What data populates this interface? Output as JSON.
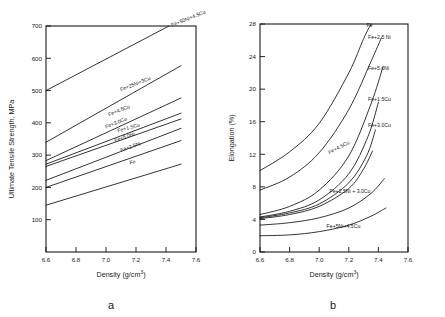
{
  "figure": {
    "panels": [
      {
        "caption": "a",
        "chart_index": 0
      },
      {
        "caption": "b",
        "chart_index": 1
      }
    ]
  },
  "chart_data": [
    {
      "type": "line",
      "title": "",
      "panel_label": "a",
      "xlabel": "Density (g/cm",
      "xlabel_sup": "3",
      "xlabel_tail": ")",
      "ylabel": "Ultimate  Tensile  Strength,  MPa",
      "xlim": [
        6.6,
        7.6
      ],
      "ylim": [
        0,
        700
      ],
      "xticks": [
        6.6,
        6.8,
        7.0,
        7.2,
        7.4,
        7.6
      ],
      "xtick_labels": [
        "6.6",
        "6.8",
        "7.0",
        "7.2",
        "7.4",
        "7.6"
      ],
      "yticks": [
        100,
        200,
        300,
        400,
        500,
        600,
        700
      ],
      "ytick_labels": [
        "100",
        "200",
        "300",
        "400",
        "500",
        "600",
        "700"
      ],
      "grid": false,
      "legend_position": "inline-end-of-line",
      "series": [
        {
          "name": "Fe+50Ni+4.5Cu",
          "label": "Fe+50Ni+4.5Cu",
          "x": [
            6.6,
            7.42
          ],
          "values": [
            500,
            700
          ],
          "label_x": 7.44,
          "label_y": 697,
          "label_angle": -22
        },
        {
          "name": "Fe+25Ni+3Cu",
          "label": "Fe+25Ni+3Cu",
          "x": [
            6.6,
            7.5
          ],
          "values": [
            340,
            577
          ],
          "label_x": 7.1,
          "label_y": 497,
          "label_angle": -22
        },
        {
          "name": "Fe+4.5Cu",
          "label": "Fe+4.5Cu",
          "x": [
            6.6,
            7.5
          ],
          "values": [
            283,
            477
          ],
          "label_x": 7.02,
          "label_y": 420,
          "label_angle": -22
        },
        {
          "name": "Fe+3.0Cu",
          "label": "Fe+3.0Cu",
          "x": [
            6.6,
            7.5
          ],
          "values": [
            272,
            430
          ],
          "label_x": 7.0,
          "label_y": 382,
          "label_angle": -22
        },
        {
          "name": "Fe+1.5Cu",
          "label": "Fe+1.5Cu",
          "x": [
            6.6,
            7.5
          ],
          "values": [
            265,
            412
          ],
          "label_x": 7.08,
          "label_y": 370,
          "label_angle": -16
        },
        {
          "name": "Fe+5.0Ni",
          "label": "Fe+5.0Ni",
          "x": [
            6.6,
            7.5
          ],
          "values": [
            222,
            383
          ],
          "label_x": 7.06,
          "label_y": 340,
          "label_angle": -19
        },
        {
          "name": "Fe+2.5Ni",
          "label": "Fe+2.5Ni",
          "x": [
            6.6,
            7.5
          ],
          "values": [
            200,
            345
          ],
          "label_x": 7.1,
          "label_y": 310,
          "label_angle": -19
        },
        {
          "name": "Fe",
          "label": "Fe",
          "x": [
            6.6,
            7.5
          ],
          "values": [
            145,
            272
          ],
          "label_x": 7.16,
          "label_y": 271,
          "label_angle": -13
        }
      ]
    },
    {
      "type": "line",
      "title": "",
      "panel_label": "b",
      "xlabel": "Density (g/cm",
      "xlabel_sup": "3",
      "xlabel_tail": ")",
      "ylabel": "Elongation (%)",
      "xlim": [
        6.6,
        7.6
      ],
      "ylim": [
        0,
        28
      ],
      "xticks": [
        6.6,
        6.8,
        7.0,
        7.2,
        7.4,
        7.6
      ],
      "xtick_labels": [
        "6.6",
        "6.8",
        "7.0",
        "7.2",
        "7.4",
        "7.6"
      ],
      "yticks": [
        0,
        4,
        8,
        12,
        16,
        20,
        24,
        28
      ],
      "ytick_labels": [
        "0",
        "4",
        "8",
        "12",
        "16",
        "20",
        "24",
        "28"
      ],
      "grid": false,
      "legend_position": "inline-end-of-curve",
      "series": [
        {
          "name": "Fe",
          "label": "Fe",
          "x": [
            6.6,
            6.8,
            7.0,
            7.2,
            7.3,
            7.35
          ],
          "values": [
            10.0,
            12.3,
            15.8,
            22.0,
            26.2,
            28.0
          ],
          "label_x": 7.32,
          "label_y": 27.6,
          "label_angle": 0
        },
        {
          "name": "Fe+2.5Ni",
          "label": "Fe+2.5 Ni",
          "x": [
            6.6,
            6.8,
            7.0,
            7.2,
            7.35,
            7.42
          ],
          "values": [
            7.6,
            9.2,
            12.2,
            17.5,
            23.4,
            26.3
          ],
          "label_x": 7.33,
          "label_y": 26.2,
          "label_angle": 0
        },
        {
          "name": "Fe+5.0Ni",
          "label": "Fe+5.0Ni",
          "x": [
            6.6,
            6.8,
            7.0,
            7.2,
            7.35,
            7.43
          ],
          "values": [
            4.6,
            5.6,
            7.6,
            11.8,
            18.2,
            22.7
          ],
          "label_x": 7.33,
          "label_y": 22.3,
          "label_angle": 0
        },
        {
          "name": "Fe+1.5Cu",
          "label": "Fe+1.5Cu",
          "x": [
            6.6,
            6.8,
            7.0,
            7.2,
            7.33,
            7.4
          ],
          "values": [
            4.3,
            5.0,
            6.4,
            9.6,
            14.2,
            18.4
          ],
          "label_x": 7.33,
          "label_y": 18.5,
          "label_angle": 0
        },
        {
          "name": "Fe+3.0Cu",
          "label": "Fe+3.0Cu",
          "x": [
            6.6,
            6.8,
            7.0,
            7.2,
            7.32,
            7.38
          ],
          "values": [
            4.2,
            4.8,
            5.9,
            8.5,
            11.8,
            15.0
          ],
          "label_x": 7.33,
          "label_y": 15.4,
          "label_angle": 0
        },
        {
          "name": "Fe+4.5Cu",
          "label": "Fe+4.5Cu",
          "x": [
            6.6,
            6.8,
            7.0,
            7.2,
            7.3,
            7.36
          ],
          "values": [
            4.1,
            4.6,
            5.6,
            7.8,
            10.2,
            12.4
          ],
          "label_x": 7.07,
          "label_y": 12.0,
          "label_angle": -28
        },
        {
          "name": "Fe+2.5Ni+3.0Cu",
          "label": "Fe+2.5Ni + 3.0Cu",
          "x": [
            6.6,
            6.8,
            7.0,
            7.2,
            7.35,
            7.44
          ],
          "values": [
            3.3,
            3.6,
            4.2,
            5.4,
            7.2,
            9.0
          ],
          "label_x": 7.07,
          "label_y": 7.3,
          "label_angle": 0
        },
        {
          "name": "Fe+5Ni+4.5Cu",
          "label": "Fe+5Ni+4.5Cu",
          "x": [
            6.6,
            6.8,
            7.0,
            7.2,
            7.35,
            7.45
          ],
          "values": [
            2.0,
            2.1,
            2.5,
            3.3,
            4.4,
            5.4
          ],
          "label_x": 7.05,
          "label_y": 3.0,
          "label_angle": 0
        }
      ]
    }
  ]
}
